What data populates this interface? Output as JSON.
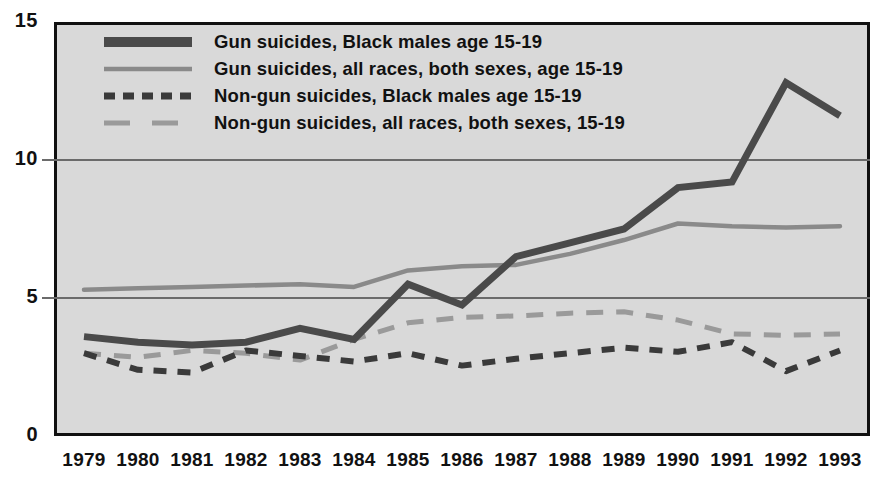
{
  "chart_data": {
    "type": "line",
    "title": "",
    "xlabel": "",
    "ylabel": "",
    "categories": [
      "1979",
      "1980",
      "1981",
      "1982",
      "1983",
      "1984",
      "1985",
      "1986",
      "1987",
      "1988",
      "1989",
      "1990",
      "1991",
      "1992",
      "1993"
    ],
    "x": [
      1979,
      1980,
      1981,
      1982,
      1983,
      1984,
      1985,
      1986,
      1987,
      1988,
      1989,
      1990,
      1991,
      1992,
      1993
    ],
    "ylim": [
      0,
      15
    ],
    "xlim": [
      1979,
      1993
    ],
    "yticks": [
      "0",
      "5",
      "10",
      "15"
    ],
    "ytick_values": [
      0,
      5,
      10,
      15
    ],
    "grid": "horizontal gridlines at 5 and 10",
    "legend_position": "top-left inside plot area",
    "series": [
      {
        "name": "Gun suicides, Black males age 15-19",
        "style": "solid-thick",
        "color": "#4a4a4a",
        "values": [
          3.6,
          3.4,
          3.3,
          3.4,
          3.9,
          3.5,
          5.5,
          4.75,
          6.5,
          7.0,
          7.5,
          9.0,
          9.2,
          12.8,
          11.6
        ]
      },
      {
        "name": "Gun suicides, all races, both sexes, age 15-19",
        "style": "solid-thin",
        "color": "#8a8a8a",
        "values": [
          5.3,
          5.35,
          5.4,
          5.45,
          5.5,
          5.4,
          6.0,
          6.15,
          6.2,
          6.6,
          7.1,
          7.7,
          7.6,
          7.55,
          7.6
        ]
      },
      {
        "name": "Non-gun suicides, Black males age 15-19",
        "style": "dashed-short",
        "color": "#3a3a3a",
        "values": [
          3.0,
          2.4,
          2.3,
          3.1,
          2.9,
          2.7,
          3.0,
          2.55,
          2.8,
          3.0,
          3.2,
          3.05,
          3.4,
          2.35,
          3.1
        ]
      },
      {
        "name": "Non-gun suicides, all races, both sexes, 15-19",
        "style": "dashed-long",
        "color": "#9a9a9a",
        "values": [
          3.0,
          2.85,
          3.1,
          3.0,
          2.75,
          3.5,
          4.1,
          4.3,
          4.35,
          4.45,
          4.5,
          4.2,
          3.7,
          3.65,
          3.7
        ]
      }
    ]
  },
  "legend": {
    "items": [
      {
        "label": "Gun suicides, Black males age 15-19",
        "swatch": "solid-thick-dark"
      },
      {
        "label": "Gun suicides, all races, both sexes, age 15-19",
        "swatch": "solid-thin-gray"
      },
      {
        "label": "Non-gun suicides, Black males age 15-19",
        "swatch": "dashed-short-dark"
      },
      {
        "label": "Non-gun suicides, all races, both sexes, 15-19",
        "swatch": "dashed-long-gray"
      }
    ]
  },
  "axes": {
    "y_labels": [
      "15",
      "10",
      "5",
      "0"
    ],
    "x_labels": [
      "1979",
      "1980",
      "1981",
      "1982",
      "1983",
      "1984",
      "1985",
      "1986",
      "1987",
      "1988",
      "1989",
      "1990",
      "1991",
      "1992",
      "1993"
    ]
  },
  "colors": {
    "plot_background": "#d9d9d9",
    "frame": "#111111",
    "gridline": "#6b6b6b",
    "series_dark": "#4a4a4a",
    "series_gray": "#8a8a8a",
    "series_dark_dash": "#3a3a3a",
    "series_gray_dash": "#9a9a9a",
    "text": "#111111"
  }
}
